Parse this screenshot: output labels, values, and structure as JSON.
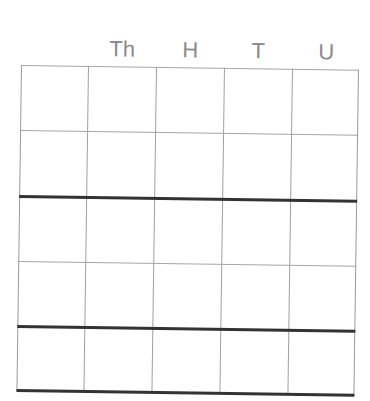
{
  "worksheet": {
    "type": "place-value-grid",
    "headers": [
      {
        "label": "Th"
      },
      {
        "label": "H"
      },
      {
        "label": "T"
      },
      {
        "label": "U"
      }
    ],
    "columns": 5,
    "rows": 5,
    "thick_separators_after_rows": [
      2,
      4,
      5
    ],
    "cells": [
      [
        "",
        "",
        "",
        "",
        ""
      ],
      [
        "",
        "",
        "",
        "",
        ""
      ],
      [
        "",
        "",
        "",
        "",
        ""
      ],
      [
        "",
        "",
        "",
        "",
        ""
      ],
      [
        "",
        "",
        "",
        "",
        ""
      ]
    ]
  }
}
